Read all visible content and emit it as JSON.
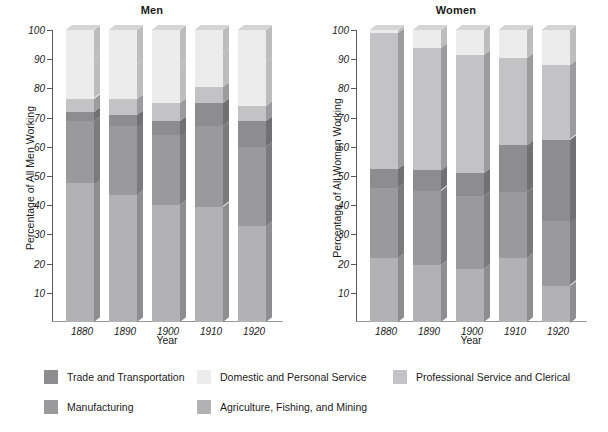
{
  "chart_data": [
    {
      "type": "bar",
      "title": "Men",
      "xlabel": "Year",
      "ylabel": "Percentage of All Men Working",
      "categories": [
        "1880",
        "1890",
        "1900",
        "1910",
        "1920"
      ],
      "ylim": [
        0,
        100
      ],
      "yticks": [
        10,
        20,
        30,
        40,
        50,
        60,
        70,
        80,
        90,
        100
      ],
      "grid": false,
      "stacked": true,
      "legend_position": "bottom",
      "series": [
        {
          "name": "Agriculture, Fishing, and Mining",
          "values": [
            47.5,
            43.5,
            40.0,
            39.5,
            33.0
          ]
        },
        {
          "name": "Manufacturing",
          "values": [
            21.5,
            23.5,
            24.0,
            27.5,
            27.0
          ]
        },
        {
          "name": "Trade and Transportation",
          "values": [
            3.0,
            4.0,
            5.0,
            8.0,
            9.0
          ]
        },
        {
          "name": "Professional Service and Clerical",
          "values": [
            4.5,
            5.5,
            6.0,
            5.5,
            5.0
          ]
        },
        {
          "name": "Domestic and Personal Service",
          "values": [
            13.5,
            12.0,
            13.0,
            11.5,
            15.0
          ]
        },
        {
          "name": "Remainder to 100",
          "values": [
            10.0,
            11.5,
            12.0,
            8.0,
            11.0
          ]
        }
      ]
    },
    {
      "type": "bar",
      "title": "Women",
      "xlabel": "Year",
      "ylabel": "Percentage of All Women Working",
      "categories": [
        "1880",
        "1890",
        "1900",
        "1910",
        "1920"
      ],
      "ylim": [
        0,
        100
      ],
      "yticks": [
        10,
        20,
        30,
        40,
        50,
        60,
        70,
        80,
        90,
        100
      ],
      "grid": false,
      "stacked": true,
      "legend_position": "bottom",
      "series": [
        {
          "name": "Agriculture, Fishing, and Mining",
          "values": [
            22.0,
            19.5,
            18.0,
            22.0,
            12.5
          ]
        },
        {
          "name": "Manufacturing",
          "values": [
            24.0,
            25.5,
            25.0,
            22.5,
            22.0
          ]
        },
        {
          "name": "Trade and Transportation",
          "values": [
            6.5,
            7.0,
            8.0,
            16.0,
            28.0
          ]
        },
        {
          "name": "Professional Service and Clerical",
          "values": [
            46.5,
            42.0,
            40.5,
            30.0,
            25.5
          ]
        },
        {
          "name": "Domestic and Personal Service",
          "values": [
            1.0,
            6.0,
            8.5,
            9.5,
            12.0
          ]
        }
      ]
    }
  ],
  "panels": [
    {
      "key": "men",
      "title": "Men",
      "ylabel": "Percentage of All Men Working",
      "xlabel": "Year",
      "ytick_labels": [
        "100",
        "90",
        "80",
        "70",
        "60",
        "50",
        "40",
        "30",
        "20",
        "10"
      ],
      "xtick_labels": [
        "1880",
        "1890",
        "1900",
        "1910",
        "1920"
      ]
    },
    {
      "key": "women",
      "title": "Women",
      "ylabel": "Percentage of All Women Working",
      "xlabel": "Year",
      "ytick_labels": [
        "100",
        "90",
        "80",
        "70",
        "60",
        "50",
        "40",
        "30",
        "20",
        "10"
      ],
      "xtick_labels": [
        "1880",
        "1890",
        "1900",
        "1910",
        "1920"
      ]
    }
  ],
  "legend": {
    "items": [
      {
        "label": "Trade and Transportation",
        "color": "#8d8d90"
      },
      {
        "label": "Domestic and Personal Service",
        "color": "#ececec"
      },
      {
        "label": "Professional Service and Clerical",
        "color": "#c3c3c5"
      },
      {
        "label": "Manufacturing",
        "color": "#9a9a9c"
      },
      {
        "label": "Agriculture, Fishing, and Mining",
        "color": "#b2b2b4"
      }
    ]
  },
  "colors": {
    "trade": "#8d8d90",
    "domestic": "#ececec",
    "professional": "#c3c3c5",
    "manufacturing": "#9a9a9c",
    "agriculture": "#b2b2b4",
    "axis": "#58585a",
    "text": "#1a1a1a",
    "background": "#ffffff"
  }
}
